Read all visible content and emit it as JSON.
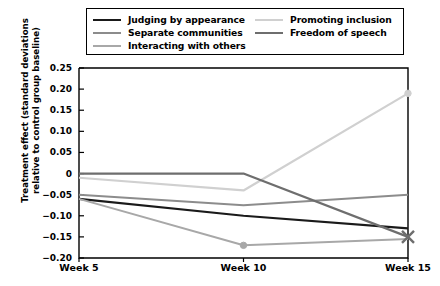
{
  "chart_data": {
    "type": "line",
    "title": "",
    "xlabel": "",
    "ylabel": "Treatment effect (standard deviations relative to control group baseline)",
    "categories": [
      "Week 5",
      "Week 10",
      "Week 15"
    ],
    "x": [
      5,
      10,
      15
    ],
    "ylim": [
      -0.2,
      0.25
    ],
    "yticks": [
      "0.25",
      "0.20",
      "0.15",
      "0.10",
      "0.05",
      "0",
      "−0.05",
      "−0.10",
      "−0.15",
      "−0.20"
    ],
    "ytick_values": [
      0.25,
      0.2,
      0.15,
      0.1,
      0.05,
      0,
      -0.05,
      -0.1,
      -0.15,
      -0.2
    ],
    "grid": false,
    "legend_position": "top",
    "series": [
      {
        "name": "Judging by appearance",
        "color": "#1a1a1a",
        "width": 2.2,
        "marker": "none",
        "values": [
          -0.06,
          -0.1,
          -0.13
        ]
      },
      {
        "name": "Separate communities",
        "color": "#8c8c8c",
        "width": 2.0,
        "marker": "none",
        "values": [
          -0.05,
          -0.075,
          -0.05
        ]
      },
      {
        "name": "Interacting with others",
        "color": "#a8a8a8",
        "width": 2.0,
        "marker": "dot",
        "values": [
          -0.06,
          -0.17,
          -0.155
        ]
      },
      {
        "name": "Promoting inclusion",
        "color": "#d0d0d0",
        "width": 2.2,
        "marker": "dot",
        "values": [
          -0.01,
          -0.04,
          0.19
        ]
      },
      {
        "name": "Freedom of speech",
        "color": "#6e6e6e",
        "width": 2.2,
        "marker": "cross",
        "values": [
          0.0,
          0.0,
          -0.15
        ]
      }
    ]
  },
  "legend": {
    "columns": [
      [
        {
          "label": "Judging by appearance",
          "color": "#1a1a1a",
          "width": 2.6
        },
        {
          "label": "Separate communities",
          "color": "#8c8c8c",
          "width": 2.2
        },
        {
          "label": "Interacting with others",
          "color": "#a8a8a8",
          "width": 2.2
        }
      ],
      [
        {
          "label": "Promoting inclusion",
          "color": "#d0d0d0",
          "width": 2.6
        },
        {
          "label": "Freedom of speech",
          "color": "#6e6e6e",
          "width": 2.6
        }
      ]
    ]
  },
  "axes": {
    "y_title": "Treatment effect (standard deviations relative to control group baseline)",
    "x_labels": [
      "Week 5",
      "Week 10",
      "Week 15"
    ],
    "frame_color": "#000000"
  }
}
